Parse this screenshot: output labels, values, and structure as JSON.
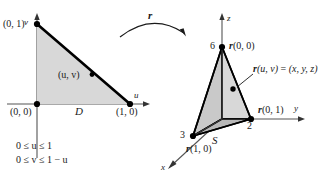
{
  "figure": {
    "colors": {
      "fill_light": "#d8d8d8",
      "fill_mid": "#c9c9c9",
      "fill_dark": "#b8b8b8",
      "stroke": "#000000",
      "axis": "#555555",
      "text": "#1a1a1a"
    }
  },
  "left_panel": {
    "name": "uv-plane domain",
    "axis_u_label": "u",
    "axis_v_label": "v",
    "region_label": "D",
    "vertex_top_label": "(0, 1)",
    "vertex_origin_label": "(0, 0)",
    "vertex_right_label": "(1, 0)",
    "interior_point_label": "(u, v)",
    "inequalities": [
      "0 ≤ u ≤ 1",
      "0 ≤ v ≤ 1 − u"
    ]
  },
  "mapping_arrow": {
    "label": "r",
    "description": "curved arrow from domain D to surface S"
  },
  "right_panel": {
    "name": "xyz-space surface",
    "axis_x_label": "x",
    "axis_y_label": "y",
    "axis_z_label": "z",
    "surface_label": "S",
    "apex_tick_label": "6",
    "apex_point_label": "r(0, 0)",
    "y_intercept_tick_label": "2",
    "y_intercept_point_label": "r(0, 1)",
    "x_intercept_tick_label": "3",
    "x_intercept_point_label": "r(1, 0)",
    "interior_point_label": "r(u, v) = (x, y, z)"
  }
}
